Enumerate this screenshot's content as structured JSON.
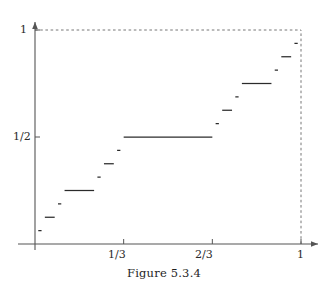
{
  "figure": {
    "caption": "Figure 5.3.4",
    "colors": {
      "axis": "#555555",
      "curve": "#2b2b2b",
      "dashed": "#777777",
      "text": "#1f1f1f",
      "background": "#ffffff"
    }
  },
  "axes": {
    "x_labels": [
      {
        "text": "1/3",
        "value": 0.3333
      },
      {
        "text": "2/3",
        "value": 0.6667
      },
      {
        "text": "1",
        "value": 1.0
      }
    ],
    "y_labels": [
      {
        "text": "1/2",
        "value": 0.5
      },
      {
        "text": "1",
        "value": 1.0
      }
    ],
    "x_ticks": [
      0.3333,
      0.6667,
      1.0
    ],
    "y_ticks": [
      0.5,
      1.0
    ],
    "xlim": [
      0,
      1
    ],
    "ylim": [
      0,
      1
    ],
    "origin_px": {
      "x": 35,
      "y": 244
    },
    "unit_px": {
      "x": 266,
      "y": 214
    }
  },
  "chart_data": {
    "type": "line",
    "title": "",
    "subtitle": "",
    "xlabel": "",
    "ylabel": "",
    "xlim": [
      0,
      1
    ],
    "ylim": [
      0,
      1
    ],
    "grid": false,
    "legend": "none",
    "annotations": [
      {
        "text": "1",
        "axis": "y",
        "value": 1.0
      },
      {
        "text": "1/2",
        "axis": "y",
        "value": 0.5
      },
      {
        "text": "1/3",
        "axis": "x",
        "value": 0.3333
      },
      {
        "text": "2/3",
        "axis": "x",
        "value": 0.6667
      },
      {
        "text": "1",
        "axis": "x",
        "value": 1.0
      }
    ],
    "reference_lines": [
      {
        "orientation": "horizontal",
        "y": 1.0,
        "style": "dashed"
      },
      {
        "orientation": "vertical",
        "x": 1.0,
        "style": "dashed"
      }
    ],
    "series": [
      {
        "name": "Cantor function plateaus",
        "type": "step-segments",
        "segments": [
          {
            "x0": 0.012346,
            "x1": 0.024691,
            "y": 0.0625
          },
          {
            "x0": 0.037037,
            "x1": 0.074074,
            "y": 0.125
          },
          {
            "x0": 0.08642,
            "x1": 0.098765,
            "y": 0.1875
          },
          {
            "x0": 0.111111,
            "x1": 0.222222,
            "y": 0.25
          },
          {
            "x0": 0.234568,
            "x1": 0.246914,
            "y": 0.3125
          },
          {
            "x0": 0.259259,
            "x1": 0.296296,
            "y": 0.375
          },
          {
            "x0": 0.308642,
            "x1": 0.320988,
            "y": 0.4375
          },
          {
            "x0": 0.333333,
            "x1": 0.666667,
            "y": 0.5
          },
          {
            "x0": 0.679012,
            "x1": 0.691358,
            "y": 0.5625
          },
          {
            "x0": 0.703704,
            "x1": 0.740741,
            "y": 0.625
          },
          {
            "x0": 0.753086,
            "x1": 0.765432,
            "y": 0.6875
          },
          {
            "x0": 0.777778,
            "x1": 0.888889,
            "y": 0.75
          },
          {
            "x0": 0.901235,
            "x1": 0.91358,
            "y": 0.8125
          },
          {
            "x0": 0.925926,
            "x1": 0.962963,
            "y": 0.875
          },
          {
            "x0": 0.975309,
            "x1": 0.987654,
            "y": 0.9375
          }
        ]
      }
    ]
  }
}
